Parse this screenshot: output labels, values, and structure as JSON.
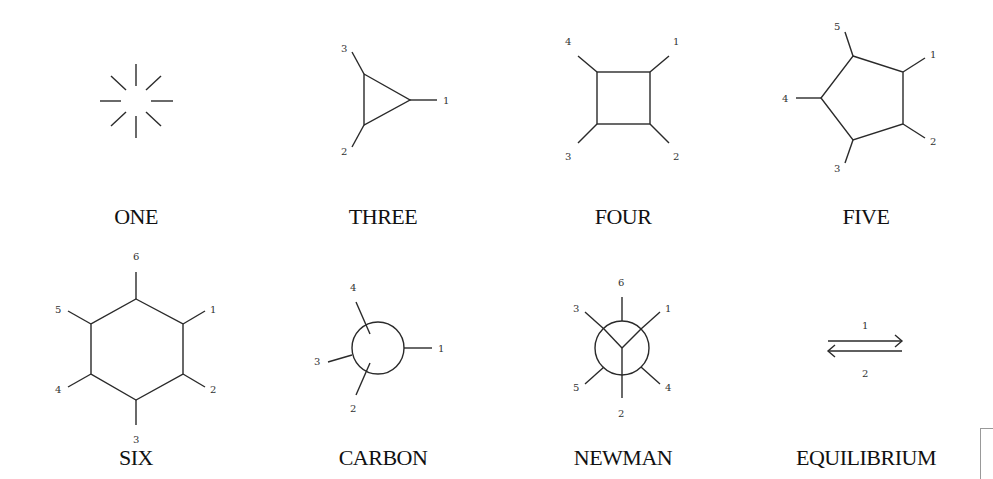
{
  "figures": [
    {
      "id": "one",
      "title": "ONE",
      "labels": []
    },
    {
      "id": "three",
      "title": "THREE",
      "labels": [
        "1",
        "2",
        "3"
      ]
    },
    {
      "id": "four",
      "title": "FOUR",
      "labels": [
        "1",
        "2",
        "3",
        "4"
      ]
    },
    {
      "id": "five",
      "title": "FIVE",
      "labels": [
        "1",
        "2",
        "3",
        "4",
        "5"
      ]
    },
    {
      "id": "six",
      "title": "SIX",
      "labels": [
        "1",
        "2",
        "3",
        "4",
        "5",
        "6"
      ]
    },
    {
      "id": "carbon",
      "title": "CARBON",
      "labels": [
        "1",
        "2",
        "3",
        "4"
      ]
    },
    {
      "id": "newman",
      "title": "NEWMAN",
      "labels": [
        "1",
        "2",
        "3",
        "4",
        "5",
        "6"
      ]
    },
    {
      "id": "equilibrium",
      "title": "EQUILIBRIUM",
      "labels": [
        "1",
        "2"
      ]
    }
  ],
  "colors": {
    "stroke": "#2a2a2a",
    "background": "#ffffff"
  }
}
